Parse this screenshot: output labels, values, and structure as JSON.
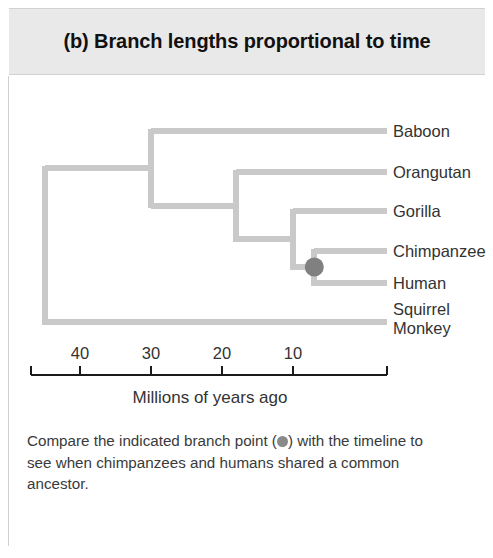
{
  "figure": {
    "panel_label": "(b)",
    "title": "(b) Branch lengths proportional to time",
    "background": "#ffffff",
    "header_background": "#e9e9e9"
  },
  "caption": {
    "before_dot": "Compare the indicated branch point (",
    "after_dot": ") with the timeline to see when chimpanzees and humans shared a common ancestor.",
    "dot_icon": "filled-circle-icon"
  },
  "axis": {
    "label": "Millions of years ago",
    "tick_labels": [
      "40",
      "30",
      "20",
      "10"
    ],
    "tick_values": [
      40,
      30,
      20,
      10
    ],
    "range_mya": [
      45,
      0
    ],
    "direction": "right-to-left-decreasing"
  },
  "chart_data": {
    "type": "diagram",
    "subtype": "phylogenetic-tree-chronogram",
    "title": "(b) Branch lengths proportional to time",
    "xlabel": "Millions of years ago",
    "ylabel": "",
    "xlim": [
      45,
      0
    ],
    "grid": false,
    "legend": null,
    "axis_ticks": [
      40,
      30,
      20,
      10
    ],
    "line_color": "#c9c9c9",
    "node_marker_color": "#808080",
    "taxa": [
      {
        "name": "Baboon",
        "row": 0
      },
      {
        "name": "Orangutan",
        "row": 1
      },
      {
        "name": "Gorilla",
        "row": 2
      },
      {
        "name": "Chimpanzee",
        "row": 3
      },
      {
        "name": "Human",
        "row": 4
      },
      {
        "name": "Squirrel Monkey",
        "row": 5
      }
    ],
    "nodes": [
      {
        "id": "root",
        "divergence_mya": 45,
        "children": [
          "catarrhines",
          "Squirrel Monkey"
        ]
      },
      {
        "id": "catarrhines",
        "divergence_mya": 30,
        "children": [
          "Baboon",
          "hominoids"
        ]
      },
      {
        "id": "hominoids",
        "divergence_mya": 18,
        "children": [
          "Orangutan",
          "african-apes"
        ]
      },
      {
        "id": "african-apes",
        "divergence_mya": 10,
        "children": [
          "Gorilla",
          "chimp-human"
        ]
      },
      {
        "id": "chimp-human",
        "divergence_mya": 7,
        "children": [
          "Chimpanzee",
          "Human"
        ],
        "marked": true
      }
    ],
    "marked_node": {
      "id": "chimp-human",
      "label": "common ancestor of chimpanzees and humans",
      "divergence_mya": 7
    }
  }
}
